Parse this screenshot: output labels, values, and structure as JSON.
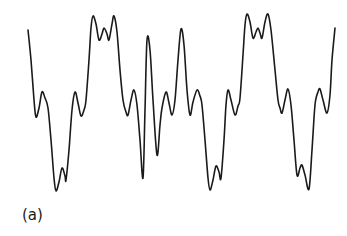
{
  "chart_data": {
    "type": "line",
    "title": "",
    "xlabel": "",
    "ylabel": "",
    "grid": false,
    "axes_visible": false,
    "legend": null,
    "panel_label": "(a)",
    "line_color": "#1a1a1a",
    "points": [
      [
        28,
        30
      ],
      [
        31,
        60
      ],
      [
        34,
        100
      ],
      [
        36,
        117
      ],
      [
        39,
        108
      ],
      [
        42,
        92
      ],
      [
        45,
        98
      ],
      [
        48,
        108
      ],
      [
        51,
        140
      ],
      [
        54,
        178
      ],
      [
        56,
        191
      ],
      [
        59,
        182
      ],
      [
        62,
        168
      ],
      [
        65,
        176
      ],
      [
        66,
        180
      ],
      [
        69,
        150
      ],
      [
        72,
        110
      ],
      [
        75,
        92
      ],
      [
        78,
        103
      ],
      [
        81,
        116
      ],
      [
        84,
        110
      ],
      [
        86,
        100
      ],
      [
        89,
        60
      ],
      [
        91,
        28
      ],
      [
        93,
        16
      ],
      [
        96,
        24
      ],
      [
        99,
        40
      ],
      [
        102,
        34
      ],
      [
        104,
        28
      ],
      [
        107,
        34
      ],
      [
        109,
        40
      ],
      [
        112,
        24
      ],
      [
        114,
        16
      ],
      [
        117,
        32
      ],
      [
        120,
        70
      ],
      [
        123,
        100
      ],
      [
        126,
        112
      ],
      [
        128,
        115
      ],
      [
        131,
        100
      ],
      [
        134,
        90
      ],
      [
        137,
        105
      ],
      [
        140,
        140
      ],
      [
        143,
        178
      ],
      [
        145,
        110
      ],
      [
        147,
        40
      ],
      [
        150,
        50
      ],
      [
        153,
        100
      ],
      [
        157,
        155
      ],
      [
        160,
        125
      ],
      [
        162,
        108
      ],
      [
        166,
        92
      ],
      [
        169,
        103
      ],
      [
        172,
        115
      ],
      [
        175,
        100
      ],
      [
        178,
        60
      ],
      [
        181,
        29
      ],
      [
        184,
        45
      ],
      [
        187,
        90
      ],
      [
        190,
        115
      ],
      [
        193,
        102
      ],
      [
        197,
        90
      ],
      [
        200,
        96
      ],
      [
        202,
        105
      ],
      [
        205,
        140
      ],
      [
        208,
        178
      ],
      [
        210,
        190
      ],
      [
        213,
        180
      ],
      [
        216,
        166
      ],
      [
        219,
        172
      ],
      [
        221,
        178
      ],
      [
        224,
        140
      ],
      [
        226,
        105
      ],
      [
        228,
        90
      ],
      [
        231,
        100
      ],
      [
        235,
        115
      ],
      [
        238,
        106
      ],
      [
        240,
        98
      ],
      [
        243,
        55
      ],
      [
        245,
        25
      ],
      [
        247,
        14
      ],
      [
        250,
        22
      ],
      [
        253,
        38
      ],
      [
        256,
        32
      ],
      [
        258,
        28
      ],
      [
        260,
        33
      ],
      [
        262,
        38
      ],
      [
        265,
        22
      ],
      [
        268,
        14
      ],
      [
        271,
        30
      ],
      [
        275,
        70
      ],
      [
        278,
        100
      ],
      [
        280,
        108
      ],
      [
        282,
        113
      ],
      [
        285,
        100
      ],
      [
        288,
        89
      ],
      [
        291,
        105
      ],
      [
        294,
        140
      ],
      [
        297,
        175
      ],
      [
        300,
        168
      ],
      [
        302,
        165
      ],
      [
        305,
        175
      ],
      [
        309,
        189
      ],
      [
        312,
        150
      ],
      [
        315,
        105
      ],
      [
        318,
        92
      ],
      [
        320,
        89
      ],
      [
        323,
        100
      ],
      [
        327,
        113
      ],
      [
        330,
        95
      ],
      [
        332,
        60
      ],
      [
        335,
        28
      ]
    ]
  }
}
